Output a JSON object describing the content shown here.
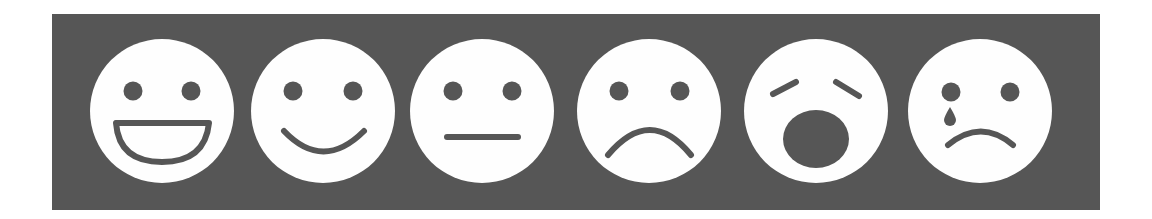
{
  "scale": {
    "title": "Pain / mood face rating scale",
    "panel_color": "#565656",
    "face_color": "#fefefe",
    "feature_color": "#565656",
    "faces": [
      {
        "index": 0,
        "label": "very happy",
        "icon": "grinning-face-icon",
        "cx": 162,
        "cy": 111
      },
      {
        "index": 1,
        "label": "happy",
        "icon": "smiling-face-icon",
        "cx": 323,
        "cy": 111
      },
      {
        "index": 2,
        "label": "neutral",
        "icon": "neutral-face-icon",
        "cx": 482,
        "cy": 111
      },
      {
        "index": 3,
        "label": "sad",
        "icon": "frowning-face-icon",
        "cx": 649,
        "cy": 111
      },
      {
        "index": 4,
        "label": "distressed",
        "icon": "anguished-face-icon",
        "cx": 816,
        "cy": 111
      },
      {
        "index": 5,
        "label": "crying",
        "icon": "crying-face-icon",
        "cx": 980,
        "cy": 111
      }
    ]
  }
}
